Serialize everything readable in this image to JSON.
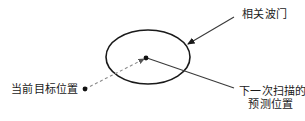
{
  "diagram": {
    "title_text_top_right": "相关波门",
    "label_bottom_left": "当前目标位置",
    "label_bottom_right_line1": "下一次扫描的",
    "label_bottom_right_line2": "预测位置",
    "colors": {
      "background": "#ffffff",
      "stroke": "#1a1a1a",
      "dashed_stroke": "#888888",
      "text": "#1a1a1a"
    },
    "shapes": {
      "ellipse": {
        "cx": 148,
        "cy": 57,
        "rx": 42,
        "ry": 27
      },
      "center_dot": {
        "cx": 146,
        "cy": 58,
        "r": 2.4
      },
      "current_position_dot": {
        "cx": 85,
        "cy": 89,
        "r": 2.4
      },
      "dashed_track": {
        "x1": 85,
        "y1": 89,
        "x2": 146,
        "y2": 58
      },
      "leader_predicted": {
        "x1": 146,
        "y1": 58,
        "x2": 234,
        "y2": 88
      },
      "arrow_gate": {
        "x1": 234,
        "y1": 17,
        "x2": 186,
        "y2": 45
      }
    }
  }
}
